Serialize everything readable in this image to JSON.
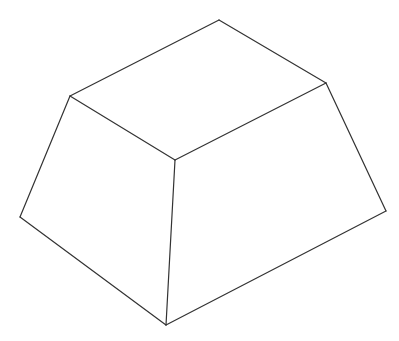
{
  "diagram": {
    "line_color": "#333333",
    "background_color": "#ffffff",
    "edges": [
      {
        "name": "top-back-left-edge",
        "from": "top_left",
        "to": "top_back"
      },
      {
        "name": "top-back-right-edge",
        "from": "top_back",
        "to": "top_right"
      },
      {
        "name": "top-front-right-edge",
        "from": "top_right",
        "to": "top_front"
      },
      {
        "name": "top-front-left-edge",
        "from": "top_front",
        "to": "top_left"
      },
      {
        "name": "left-lateral-edge",
        "from": "top_left",
        "to": "bottom_left"
      },
      {
        "name": "front-lateral-edge",
        "from": "top_front",
        "to": "bottom_front"
      },
      {
        "name": "right-lateral-edge",
        "from": "top_right",
        "to": "bottom_right"
      },
      {
        "name": "bottom-front-left-edge",
        "from": "bottom_left",
        "to": "bottom_front"
      },
      {
        "name": "bottom-front-right-edge",
        "from": "bottom_front",
        "to": "bottom_right"
      }
    ]
  }
}
